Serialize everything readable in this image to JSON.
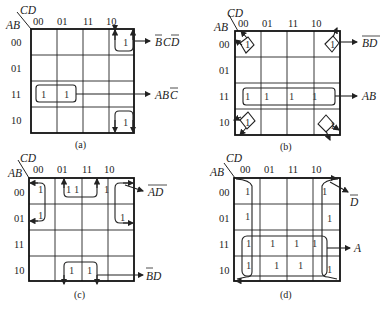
{
  "figure": {
    "row_header": "AB",
    "col_header": "CD",
    "gray_codes": [
      "00",
      "01",
      "11",
      "10"
    ],
    "maps": [
      {
        "id": "a",
        "caption": "(a)",
        "ones": [
          [
            0,
            3
          ],
          [
            2,
            0
          ],
          [
            2,
            1
          ],
          [
            3,
            3
          ]
        ],
        "groups": [
          {
            "label": "B̄C D̄",
            "cells": [
              [
                0,
                3
              ],
              [
                3,
                3
              ]
            ],
            "display": "BCD",
            "overline": [
              "B",
              "D"
            ]
          },
          {
            "label": "ABC̄",
            "cells": [
              [
                2,
                0
              ],
              [
                2,
                1
              ]
            ],
            "display": "ABC",
            "overline": [
              "C"
            ]
          }
        ]
      },
      {
        "id": "b",
        "caption": "(b)",
        "ones": [
          [
            0,
            0
          ],
          [
            0,
            3
          ],
          [
            2,
            0
          ],
          [
            2,
            1
          ],
          [
            2,
            2
          ],
          [
            2,
            3
          ],
          [
            3,
            0
          ],
          [
            3,
            3
          ]
        ],
        "groups": [
          {
            "label": "B̄D̄",
            "cells": [
              [
                0,
                0
              ],
              [
                0,
                3
              ],
              [
                3,
                0
              ],
              [
                3,
                3
              ]
            ],
            "display": "BD",
            "overline": [
              "BD"
            ]
          },
          {
            "label": "AB",
            "cells": [
              [
                2,
                0
              ],
              [
                2,
                1
              ],
              [
                2,
                2
              ],
              [
                2,
                3
              ]
            ],
            "display": "AB",
            "overline": []
          }
        ]
      },
      {
        "id": "c",
        "caption": "(c)",
        "ones": [
          [
            0,
            0
          ],
          [
            0,
            1
          ],
          [
            0,
            2
          ],
          [
            0,
            3
          ],
          [
            1,
            0
          ],
          [
            1,
            3
          ],
          [
            3,
            1
          ],
          [
            3,
            2
          ]
        ],
        "groups": [
          {
            "label": "ĀD̄",
            "cells": [
              [
                0,
                0
              ],
              [
                1,
                0
              ],
              [
                0,
                3
              ],
              [
                1,
                3
              ]
            ],
            "display": "AD",
            "overline": [
              "AD"
            ]
          },
          {
            "label": "B̄D",
            "cells": [
              [
                3,
                1
              ],
              [
                3,
                2
              ],
              [
                0,
                1
              ],
              [
                0,
                2
              ]
            ],
            "display": "BD",
            "overline": [
              "B"
            ]
          }
        ]
      },
      {
        "id": "d",
        "caption": "(d)",
        "ones": [
          [
            0,
            0
          ],
          [
            0,
            3
          ],
          [
            1,
            0
          ],
          [
            1,
            3
          ],
          [
            2,
            0
          ],
          [
            2,
            1
          ],
          [
            2,
            2
          ],
          [
            2,
            3
          ],
          [
            3,
            0
          ],
          [
            3,
            1
          ],
          [
            3,
            2
          ],
          [
            3,
            3
          ]
        ],
        "groups": [
          {
            "label": "D̄",
            "cells": [
              [
                0,
                0
              ],
              [
                1,
                0
              ],
              [
                2,
                0
              ],
              [
                3,
                0
              ],
              [
                0,
                3
              ],
              [
                1,
                3
              ],
              [
                2,
                3
              ],
              [
                3,
                3
              ]
            ],
            "display": "D",
            "overline": [
              "D"
            ]
          },
          {
            "label": "A",
            "cells": [
              [
                2,
                0
              ],
              [
                2,
                1
              ],
              [
                2,
                2
              ],
              [
                2,
                3
              ],
              [
                3,
                0
              ],
              [
                3,
                1
              ],
              [
                3,
                2
              ],
              [
                3,
                3
              ]
            ],
            "display": "A",
            "overline": []
          }
        ]
      }
    ],
    "captions": {
      "a": "(a)",
      "b": "(b)",
      "c": "(c)",
      "d": "(d)"
    },
    "group_labels": {
      "a1": "BCD",
      "a2": "ABC",
      "b1": "BD",
      "b2": "AB",
      "c1": "AD",
      "c2": "BD",
      "d1": "D",
      "d2": "A"
    }
  }
}
